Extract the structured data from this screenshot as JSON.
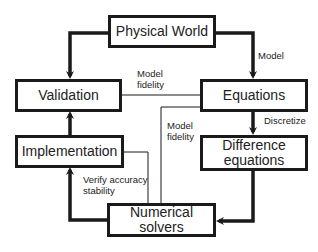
{
  "diagram": {
    "top_cutoff_text": "· · · · ·",
    "nodes": {
      "physical_world": "Physical World",
      "validation": "Validation",
      "equations": "Equations",
      "implementation": "Implementation",
      "difference_equations_line1": "Difference",
      "difference_equations_line2": "equations",
      "numerical_solvers": "Numerical solvers"
    },
    "edge_labels": {
      "model": "Model",
      "model_fidelity_top_line1": "Model",
      "model_fidelity_top_line2": "fidelity",
      "model_fidelity_mid_line1": "Model",
      "model_fidelity_mid_line2": "fidelity",
      "discretize": "Discretize",
      "verify_line1": "Verify accuracy",
      "verify_line2": "stability"
    },
    "edges": [
      {
        "from": "Physical World",
        "to": "Validation",
        "style": "thick-arrow"
      },
      {
        "from": "Physical World",
        "to": "Equations",
        "style": "thick-arrow",
        "label": "Model"
      },
      {
        "from": "Equations",
        "to": "Difference equations",
        "style": "thick-arrow",
        "label": "Discretize"
      },
      {
        "from": "Difference equations",
        "to": "Numerical solvers",
        "style": "thick-arrow"
      },
      {
        "from": "Numerical solvers",
        "to": "Implementation",
        "style": "thick-arrow"
      },
      {
        "from": "Implementation",
        "to": "Validation",
        "style": "thick-arrow"
      },
      {
        "from": "Validation",
        "to": "Equations",
        "style": "thin-line",
        "label": "Model fidelity"
      },
      {
        "from": "Numerical solvers",
        "to": "Equations",
        "style": "thin-line",
        "label": "Model fidelity"
      },
      {
        "from": "Implementation",
        "to": "Numerical solvers",
        "style": "thin-line",
        "label": "Verify accuracy stability"
      }
    ]
  }
}
